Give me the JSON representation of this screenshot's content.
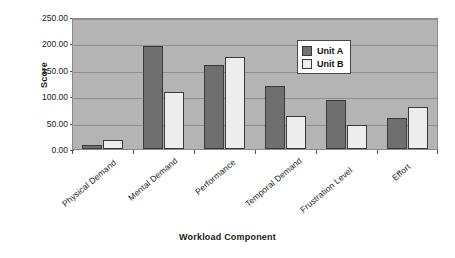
{
  "chart_data": {
    "type": "bar",
    "title": "",
    "xlabel": "Workload Component",
    "ylabel": "Score",
    "categories": [
      "Physical Demand",
      "Mental Demand",
      "Performance",
      "Temporal Demand",
      "Frustration Level",
      "Effort"
    ],
    "series": [
      {
        "name": "Unit  A",
        "color": "#6f6f6f",
        "values": [
          7,
          195,
          159,
          120,
          93,
          59
        ]
      },
      {
        "name": "Unit  B",
        "color": "#ededed",
        "values": [
          17,
          108,
          174,
          62,
          45,
          80
        ]
      }
    ],
    "ylim": [
      0,
      250
    ],
    "ytick_values": [
      0,
      50,
      100,
      150,
      200,
      250
    ],
    "ytick_labels": [
      "0.00",
      "50.00",
      "100.00",
      "150.00",
      "200.00",
      "250.00"
    ],
    "grid": true,
    "legend_position": "upper-right",
    "plot_background": "#b4b4b4"
  },
  "legend": {
    "entries": [
      {
        "label": "Unit  A"
      },
      {
        "label": "Unit  B"
      }
    ]
  },
  "axes": {
    "y_title": "Score",
    "x_title": "Workload Component"
  }
}
